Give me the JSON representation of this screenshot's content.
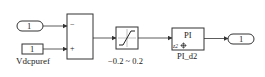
{
  "diagram": {
    "inport": {
      "value": "1"
    },
    "constant": {
      "value": "1",
      "name": "Vdcpuref"
    },
    "sum": {
      "signs": [
        "−",
        "+"
      ]
    },
    "saturation": {
      "range_label": "−0.2 ~ 0.2"
    },
    "pi_block": {
      "title": "PI",
      "port_label": "z2",
      "name": "PI_d2"
    },
    "outport": {
      "value": "1"
    },
    "colors": {
      "stroke": "#333333",
      "background": "#ffffff"
    }
  }
}
